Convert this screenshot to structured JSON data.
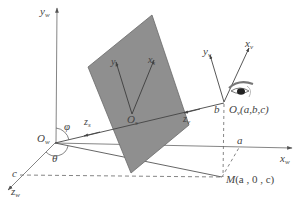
{
  "diagram": {
    "type": "coordinate-system-geometry",
    "colors": {
      "plane_fill": "#8f8f8f",
      "plane_edge": "#6a6a6a",
      "axis_line": "#555555",
      "dashed_line": "#666666",
      "label": "#444444",
      "background": "#ffffff"
    },
    "world_axes": {
      "y": {
        "base": "y",
        "sub": "w"
      },
      "x": {
        "base": "x",
        "sub": "w"
      },
      "z": {
        "base": "z",
        "sub": "w"
      },
      "origin": {
        "base": "O",
        "sub": "w"
      }
    },
    "screen_axes": {
      "y": {
        "base": "y",
        "sub": "s"
      },
      "x": {
        "base": "x",
        "sub": "s"
      },
      "z": {
        "base": "z",
        "sub": "s"
      },
      "origin": {
        "base": "O",
        "sub": "s"
      }
    },
    "viewer_axes": {
      "y": {
        "base": "y",
        "sub": "v"
      },
      "x": {
        "base": "x",
        "sub": "v"
      },
      "z": {
        "base": "z",
        "sub": "v"
      },
      "origin": {
        "base": "O",
        "sub": "v",
        "coords": "(a,b,c)"
      }
    },
    "angles": {
      "phi": "φ",
      "theta": "θ"
    },
    "points": {
      "M": {
        "name": "M",
        "coords": "(a , 0 , c)"
      },
      "a": "a",
      "b": "b",
      "c": "c"
    },
    "icons": {
      "eye": "eye-icon"
    }
  }
}
